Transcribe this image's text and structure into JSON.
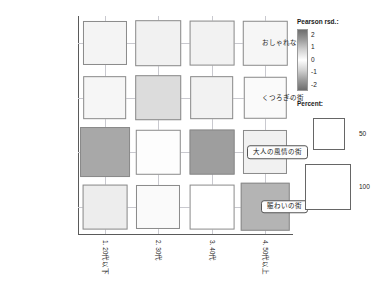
{
  "chart_data": {
    "type": "heatmap",
    "title": "",
    "xlabel": "",
    "ylabel": "",
    "x_categories": [
      "1. 20代以下",
      "2. 30代",
      "3. 40代",
      "4. 50代以上"
    ],
    "y_categories": [
      "おしゃれな街",
      "くつろぎの街",
      "大人の風情の街",
      "賑わいの街"
    ],
    "y_categories_highlighted": [
      "大人の風情の街",
      "賑わいの街"
    ],
    "legend_residual_title": "Pearson rsd.:",
    "legend_residual_ticks": [
      "2",
      "1",
      "0",
      "-1",
      "-2"
    ],
    "legend_residual_range": [
      -2,
      2
    ],
    "legend_percent_title": "Percent:",
    "legend_percent_values": [
      "50",
      "100"
    ],
    "encoding": {
      "size": "Percent",
      "fill": "Pearson residual"
    },
    "cells": [
      {
        "row": 0,
        "col": 0,
        "percent": 56,
        "residual": -0.25,
        "fill": "#f4f4f4"
      },
      {
        "row": 0,
        "col": 1,
        "percent": 60,
        "residual": -0.35,
        "fill": "#f1f1f1"
      },
      {
        "row": 0,
        "col": 2,
        "percent": 58,
        "residual": -0.3,
        "fill": "#f2f2f2"
      },
      {
        "row": 0,
        "col": 3,
        "percent": 57,
        "residual": -0.2,
        "fill": "#f6f6f6"
      },
      {
        "row": 1,
        "col": 0,
        "percent": 55,
        "residual": -0.2,
        "fill": "#f6f6f6"
      },
      {
        "row": 1,
        "col": 1,
        "percent": 60,
        "residual": -0.8,
        "fill": "#dcdcdc"
      },
      {
        "row": 1,
        "col": 2,
        "percent": 55,
        "residual": -0.3,
        "fill": "#f2f2f2"
      },
      {
        "row": 1,
        "col": 3,
        "percent": 52,
        "residual": -0.1,
        "fill": "#fafafa"
      },
      {
        "row": 2,
        "col": 0,
        "percent": 72,
        "residual": -1.8,
        "fill": "#a8a8a8"
      },
      {
        "row": 2,
        "col": 1,
        "percent": 57,
        "residual": 0.05,
        "fill": "#fdfdfd"
      },
      {
        "row": 2,
        "col": 2,
        "percent": 58,
        "residual": -1.9,
        "fill": "#9e9e9e"
      },
      {
        "row": 2,
        "col": 3,
        "percent": 56,
        "residual": -0.35,
        "fill": "#f1f1f1"
      },
      {
        "row": 3,
        "col": 0,
        "percent": 58,
        "residual": -0.45,
        "fill": "#ededed"
      },
      {
        "row": 3,
        "col": 1,
        "percent": 56,
        "residual": -0.1,
        "fill": "#fafafa"
      },
      {
        "row": 3,
        "col": 2,
        "percent": 58,
        "residual": 0.0,
        "fill": "#ffffff"
      },
      {
        "row": 3,
        "col": 3,
        "percent": 68,
        "residual": -1.5,
        "fill": "#b4b4b4"
      }
    ]
  }
}
